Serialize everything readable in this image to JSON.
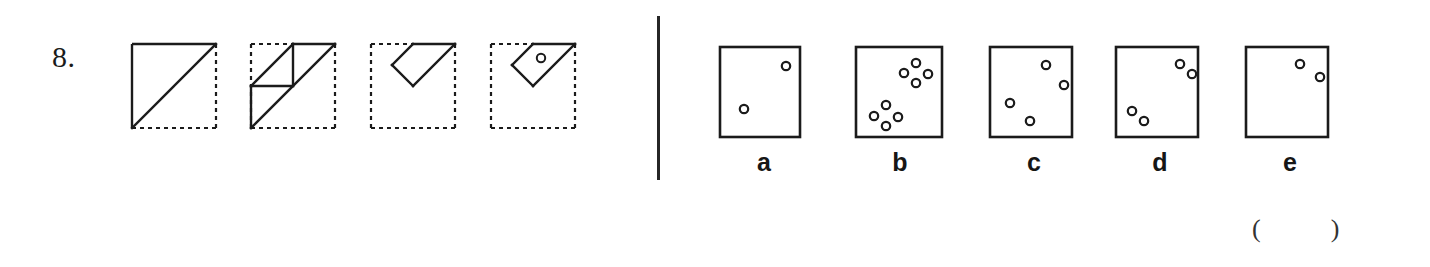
{
  "page": {
    "question_number": "8.",
    "answer_blank": "(        )",
    "ink_color": "#1b1b1b",
    "background_color": "#ffffff"
  },
  "divider": {
    "name": "vertical-rule"
  },
  "sequence": {
    "caption": "paper folding sequence",
    "stages": [
      {
        "id": "stage-1",
        "name": "fold-stage-1",
        "box": {
          "x": 8,
          "y": 6,
          "w": 84,
          "h": 84
        },
        "solid_edges": [
          "top",
          "left"
        ],
        "dotted_edges": [
          "right",
          "bottom"
        ],
        "solid_lines": [
          {
            "x1": 8,
            "y1": 90,
            "x2": 92,
            "y2": 6
          }
        ],
        "holes": []
      },
      {
        "id": "stage-2",
        "name": "fold-stage-2",
        "box": {
          "x": 8,
          "y": 6,
          "w": 84,
          "h": 84
        },
        "solid_edges": [],
        "dotted_edges": [
          "top",
          "left",
          "right",
          "bottom"
        ],
        "solid_lines": [
          {
            "x1": 8,
            "y1": 90,
            "x2": 92,
            "y2": 6
          },
          {
            "x1": 8,
            "y1": 90,
            "x2": 8,
            "y2": 48
          },
          {
            "x1": 8,
            "y1": 48,
            "x2": 50,
            "y2": 48
          },
          {
            "x1": 8,
            "y1": 48,
            "x2": 50,
            "y2": 6
          },
          {
            "x1": 50,
            "y1": 6,
            "x2": 92,
            "y2": 6
          },
          {
            "x1": 50,
            "y1": 6,
            "x2": 50,
            "y2": 48
          }
        ],
        "holes": []
      },
      {
        "id": "stage-3",
        "name": "fold-stage-3",
        "box": {
          "x": 8,
          "y": 6,
          "w": 84,
          "h": 84
        },
        "solid_edges": [],
        "dotted_edges": [
          "top",
          "left",
          "right",
          "bottom"
        ],
        "solid_lines": [
          {
            "x1": 50,
            "y1": 6,
            "x2": 92,
            "y2": 6
          },
          {
            "x1": 92,
            "y1": 6,
            "x2": 50,
            "y2": 48
          },
          {
            "x1": 50,
            "y1": 48,
            "x2": 29,
            "y2": 27
          },
          {
            "x1": 29,
            "y1": 27,
            "x2": 50,
            "y2": 6
          }
        ],
        "holes": []
      },
      {
        "id": "stage-4",
        "name": "fold-stage-4",
        "box": {
          "x": 8,
          "y": 6,
          "w": 84,
          "h": 84
        },
        "solid_edges": [],
        "dotted_edges": [
          "top",
          "left",
          "right",
          "bottom"
        ],
        "solid_lines": [
          {
            "x1": 50,
            "y1": 6,
            "x2": 92,
            "y2": 6
          },
          {
            "x1": 92,
            "y1": 6,
            "x2": 50,
            "y2": 48
          },
          {
            "x1": 50,
            "y1": 48,
            "x2": 29,
            "y2": 27
          },
          {
            "x1": 29,
            "y1": 27,
            "x2": 50,
            "y2": 6
          }
        ],
        "holes": [
          {
            "cx": 58,
            "cy": 20,
            "r": 4.2
          }
        ]
      }
    ]
  },
  "options": {
    "labels": [
      "a",
      "b",
      "c",
      "d",
      "e"
    ],
    "items": [
      {
        "id": "option-a",
        "name": "option-a",
        "label": "a",
        "hole_count": 2,
        "box": {
          "x": 6,
          "y": 5,
          "w": 80,
          "h": 90
        },
        "holes": [
          {
            "cx": 66,
            "cy": 19,
            "r": 4.2
          },
          {
            "cx": 24,
            "cy": 62,
            "r": 4.2
          }
        ]
      },
      {
        "id": "option-b",
        "name": "option-b",
        "label": "b",
        "hole_count": 8,
        "box": {
          "x": 6,
          "y": 5,
          "w": 86,
          "h": 90
        },
        "holes": [
          {
            "cx": 60,
            "cy": 16,
            "r": 4.2
          },
          {
            "cx": 48,
            "cy": 26,
            "r": 4.2
          },
          {
            "cx": 72,
            "cy": 27,
            "r": 4.2
          },
          {
            "cx": 60,
            "cy": 36,
            "r": 4.2
          },
          {
            "cx": 30,
            "cy": 58,
            "r": 4.2
          },
          {
            "cx": 18,
            "cy": 69,
            "r": 4.2
          },
          {
            "cx": 42,
            "cy": 70,
            "r": 4.2
          },
          {
            "cx": 30,
            "cy": 79,
            "r": 4.2
          }
        ]
      },
      {
        "id": "option-c",
        "name": "option-c",
        "label": "c",
        "hole_count": 4,
        "box": {
          "x": 6,
          "y": 5,
          "w": 82,
          "h": 90
        },
        "holes": [
          {
            "cx": 56,
            "cy": 18,
            "r": 4.2
          },
          {
            "cx": 74,
            "cy": 38,
            "r": 4.2
          },
          {
            "cx": 20,
            "cy": 56,
            "r": 4.2
          },
          {
            "cx": 40,
            "cy": 74,
            "r": 4.2
          }
        ]
      },
      {
        "id": "option-d",
        "name": "option-d",
        "label": "d",
        "hole_count": 4,
        "box": {
          "x": 6,
          "y": 5,
          "w": 82,
          "h": 90
        },
        "holes": [
          {
            "cx": 64,
            "cy": 17,
            "r": 4.2
          },
          {
            "cx": 76,
            "cy": 27,
            "r": 4.2
          },
          {
            "cx": 16,
            "cy": 64,
            "r": 4.2
          },
          {
            "cx": 28,
            "cy": 74,
            "r": 4.2
          }
        ]
      },
      {
        "id": "option-e",
        "name": "option-e",
        "label": "e",
        "hole_count": 2,
        "box": {
          "x": 6,
          "y": 5,
          "w": 82,
          "h": 90
        },
        "holes": [
          {
            "cx": 54,
            "cy": 17,
            "r": 4.2
          },
          {
            "cx": 74,
            "cy": 30,
            "r": 4.2
          }
        ]
      }
    ]
  }
}
